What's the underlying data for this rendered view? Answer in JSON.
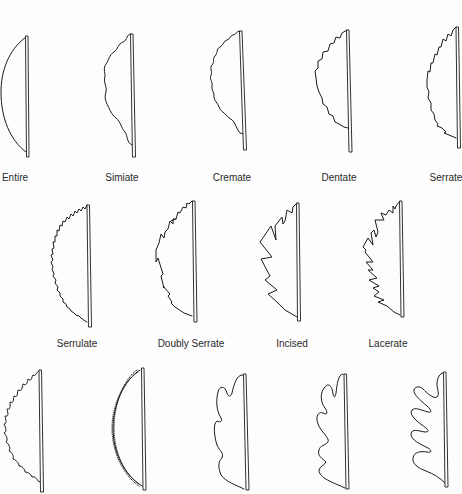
{
  "figure": {
    "type": "leaf-margin-types",
    "colors": {
      "background": "#fdfdfd",
      "stroke": "#1a1a1a",
      "label": "#2a2a2a"
    },
    "rows": [
      {
        "items": [
          {
            "id": "entire",
            "label": "Entire"
          },
          {
            "id": "simiate",
            "label": "Simiate"
          },
          {
            "id": "cremate",
            "label": "Cremate"
          },
          {
            "id": "dentate",
            "label": "Dentate"
          },
          {
            "id": "serrate",
            "label": "Serrate"
          }
        ]
      },
      {
        "items": [
          {
            "id": "serrulate",
            "label": "Serrulate"
          },
          {
            "id": "doubly-serrate",
            "label": "Doubly Serrate"
          },
          {
            "id": "incised",
            "label": "Incised"
          },
          {
            "id": "lacerate",
            "label": "Lacerate"
          }
        ]
      },
      {
        "items": [
          {
            "id": "spiny",
            "label": ""
          },
          {
            "id": "ciliate",
            "label": ""
          },
          {
            "id": "lobed",
            "label": ""
          },
          {
            "id": "cleft",
            "label": ""
          },
          {
            "id": "parted",
            "label": ""
          }
        ]
      }
    ]
  }
}
